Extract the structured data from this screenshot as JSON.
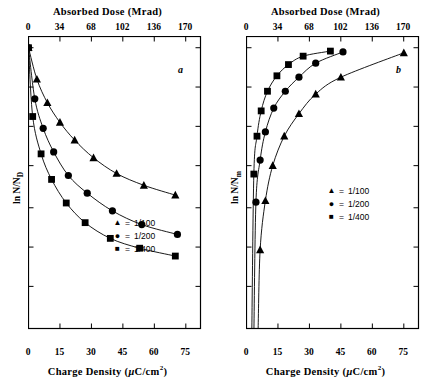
{
  "figure": {
    "panels": [
      {
        "letter": "a",
        "top_axis_title": "Absorbed Dose (Mrad)",
        "bottom_axis_title_pre": "Charge Density (",
        "bottom_axis_title_mu": "μ",
        "bottom_axis_title_mid": "C/cm",
        "bottom_axis_title_sup": "2",
        "bottom_axis_title_post": ")",
        "ylabel_pre": "ln N/N",
        "ylabel_sub": "D",
        "legend": [
          {
            "marker": "triangle",
            "glyph": "▲",
            "eq": "=",
            "label": "1/100"
          },
          {
            "marker": "circle",
            "glyph": "●",
            "eq": "=",
            "label": "1/200"
          },
          {
            "marker": "square",
            "glyph": "■",
            "eq": "=",
            "label": "1/400"
          }
        ]
      },
      {
        "letter": "b",
        "top_axis_title": "Absorbed Dose (Mrad)",
        "bottom_axis_title_pre": "Charge Density (",
        "bottom_axis_title_mu": "μ",
        "bottom_axis_title_mid": "C/cm",
        "bottom_axis_title_sup": "2",
        "bottom_axis_title_post": ")",
        "ylabel_pre": "ln N/N",
        "ylabel_sub": "m",
        "legend": [
          {
            "marker": "triangle",
            "glyph": "▲",
            "eq": "=",
            "label": "1/100"
          },
          {
            "marker": "circle",
            "glyph": "●",
            "eq": "=",
            "label": "1/200"
          },
          {
            "marker": "square",
            "glyph": "■",
            "eq": "=",
            "label": "1/400"
          }
        ]
      }
    ]
  },
  "chart_data": [
    {
      "type": "scatter",
      "title": "",
      "panel_label": "a",
      "xlabel": "Charge Density (μC/cm2)",
      "xlabel_top": "Absorbed Dose (Mrad)",
      "ylabel": "ln N/ND",
      "xlim": [
        0,
        82
      ],
      "ylim": [
        -1.0,
        0.04
      ],
      "xticks": [
        0,
        15,
        30,
        45,
        60,
        75
      ],
      "xticklabels": [
        "0",
        "15",
        "30",
        "45",
        "60",
        "75"
      ],
      "xticks_top": [
        0,
        34,
        68,
        102,
        136,
        170
      ],
      "xticklabels_top": [
        "0",
        "34",
        "68",
        "102",
        "136",
        "170"
      ],
      "top_axis_max": 186,
      "yticks": [
        0,
        -0.14,
        -0.28,
        -0.42,
        -0.57,
        -0.71,
        -0.85
      ],
      "yticklabels": [
        "",
        "",
        "",
        "",
        "",
        "",
        ""
      ],
      "grid": false,
      "legend_position": "lower-center",
      "series": [
        {
          "name": "1/100",
          "marker": "triangle",
          "x": [
            0,
            4,
            9,
            15,
            22,
            31,
            42,
            55,
            70
          ],
          "y": [
            0,
            -0.112,
            -0.196,
            -0.266,
            -0.329,
            -0.392,
            -0.448,
            -0.49,
            -0.525
          ]
        },
        {
          "name": "1/200",
          "marker": "circle",
          "x": [
            0,
            3,
            7,
            12,
            19,
            28,
            40,
            54,
            71
          ],
          "y": [
            0,
            -0.182,
            -0.287,
            -0.371,
            -0.455,
            -0.518,
            -0.581,
            -0.63,
            -0.665
          ]
        },
        {
          "name": "1/400",
          "marker": "square",
          "x": [
            0,
            2,
            6,
            11,
            18,
            27,
            39,
            53,
            70
          ],
          "y": [
            0,
            -0.245,
            -0.378,
            -0.469,
            -0.553,
            -0.623,
            -0.679,
            -0.714,
            -0.742
          ]
        }
      ]
    },
    {
      "type": "scatter",
      "title": "",
      "panel_label": "b",
      "xlabel": "Charge Density (μC/cm2)",
      "xlabel_top": "Absorbed Dose (Mrad)",
      "ylabel": "ln N/Nm",
      "xlim": [
        0,
        82
      ],
      "ylim": [
        -1.0,
        0.04
      ],
      "xticks": [
        0,
        15,
        30,
        45,
        60,
        75
      ],
      "xticklabels": [
        "0",
        "15",
        "30",
        "45",
        "60",
        "75"
      ],
      "xticks_top": [
        0,
        34,
        68,
        102,
        136,
        170
      ],
      "xticklabels_top": [
        "0",
        "34",
        "68",
        "102",
        "136",
        "170"
      ],
      "top_axis_max": 186,
      "yticks": [
        0,
        -0.14,
        -0.28,
        -0.42,
        -0.57,
        -0.71,
        -0.85
      ],
      "yticklabels": [
        "",
        "",
        "",
        "",
        "",
        "",
        ""
      ],
      "grid": false,
      "legend_position": "lower-right",
      "series": [
        {
          "name": "1/100",
          "marker": "triangle",
          "x": [
            6.5,
            9,
            12.5,
            18,
            25,
            33,
            45,
            75
          ],
          "y": [
            -0.72,
            -0.545,
            -0.42,
            -0.315,
            -0.235,
            -0.165,
            -0.105,
            -0.018
          ]
        },
        {
          "name": "1/200",
          "marker": "circle",
          "x": [
            4.5,
            6.5,
            9,
            13,
            18.5,
            25,
            33,
            46
          ],
          "y": [
            -0.55,
            -0.4,
            -0.3,
            -0.215,
            -0.155,
            -0.105,
            -0.055,
            -0.015
          ]
        },
        {
          "name": "1/400",
          "marker": "square",
          "x": [
            3.5,
            5,
            7,
            10,
            14.5,
            20,
            27,
            40
          ],
          "y": [
            -0.45,
            -0.315,
            -0.225,
            -0.155,
            -0.1,
            -0.06,
            -0.03,
            -0.012
          ]
        }
      ]
    }
  ]
}
